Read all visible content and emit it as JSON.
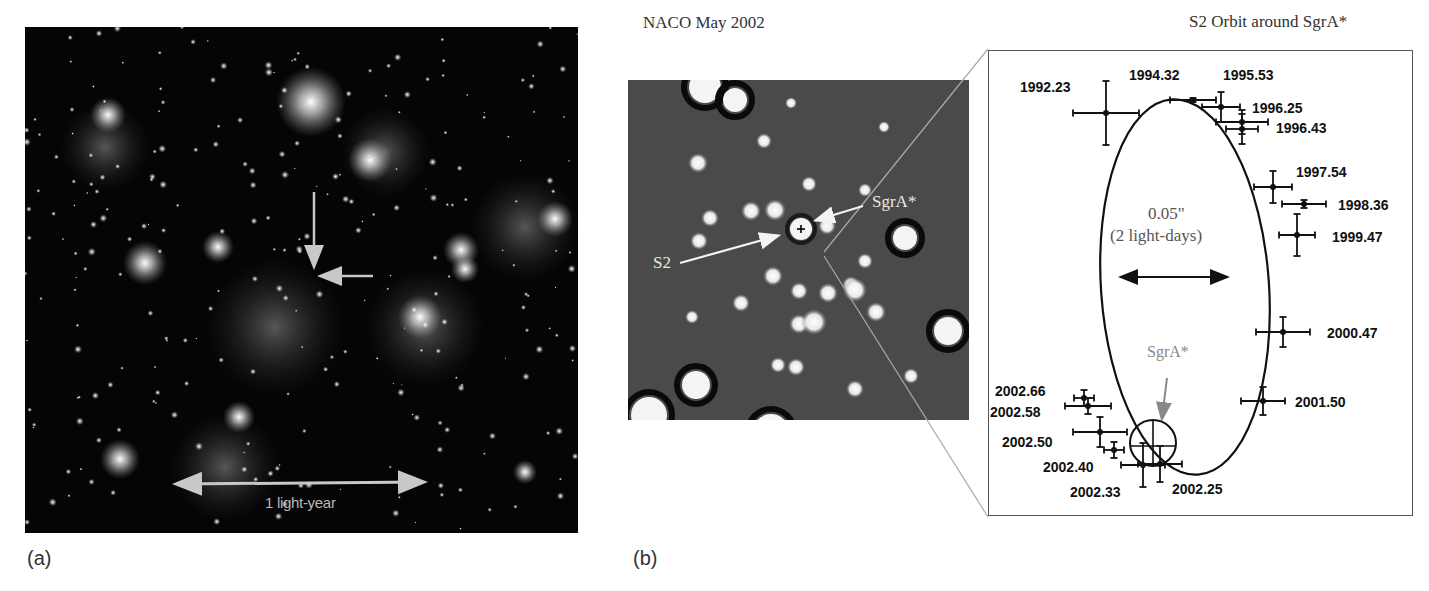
{
  "figure": {
    "panel_a": {
      "label": "(a)",
      "scale_bar_text": "1 light-year",
      "arrow_color": "#c8c8c8"
    },
    "panel_b": {
      "label": "(b)",
      "title": "NACO May 2002",
      "annotations": {
        "sgra": "SgrA*",
        "s2": "S2"
      }
    },
    "orbit_panel": {
      "title": "S2 Orbit around SgrA*",
      "scale_text_line1": "0.05\"",
      "scale_text_line2": "(2 light-days)",
      "sgra_label": "SgrA*",
      "sgra_color": "#888888"
    }
  },
  "chart_data": {
    "type": "scatter",
    "title": "S2 Orbit around SgrA*",
    "xlabel": "",
    "ylabel": "",
    "scale": "0.05\" (2 light-days)",
    "focus": "SgrA*",
    "series": [
      {
        "name": "S2 positions",
        "points": [
          {
            "epoch": "1992.23"
          },
          {
            "epoch": "1994.32"
          },
          {
            "epoch": "1995.53"
          },
          {
            "epoch": "1996.25"
          },
          {
            "epoch": "1996.43"
          },
          {
            "epoch": "1997.54"
          },
          {
            "epoch": "1998.36"
          },
          {
            "epoch": "1999.47"
          },
          {
            "epoch": "2000.47"
          },
          {
            "epoch": "2001.50"
          },
          {
            "epoch": "2002.25"
          },
          {
            "epoch": "2002.33"
          },
          {
            "epoch": "2002.40"
          },
          {
            "epoch": "2002.50"
          },
          {
            "epoch": "2002.58"
          },
          {
            "epoch": "2002.66"
          }
        ]
      }
    ],
    "orbit_fit": "ellipse"
  }
}
